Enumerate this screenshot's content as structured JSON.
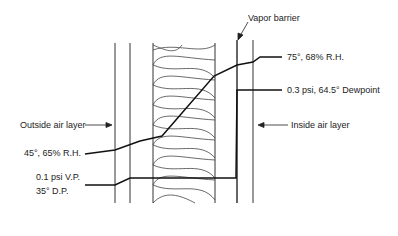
{
  "diagram": {
    "type": "wall cross-section vapor/temperature gradient",
    "labels": {
      "vapor_barrier": "Vapor barrier",
      "inside_temp": "75°, 68% R.H.",
      "inside_vp": "0.3 psi, 64.5° Dewpoint",
      "outside_air_layer": "Outside air layer",
      "inside_air_layer": "Inside air layer",
      "outside_temp": "45°, 65% R.H.",
      "outside_vp": "0.1 psi V.P.",
      "outside_dp": "35° D.P."
    },
    "layers": [
      "outside sheathing",
      "air gap",
      "insulation batt",
      "vapor barrier",
      "inside wall"
    ]
  }
}
